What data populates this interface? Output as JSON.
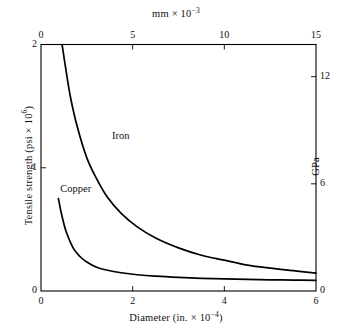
{
  "chart_data": {
    "type": "line",
    "title": "",
    "xlabel": "Diameter (in. × 10⁻⁴)",
    "ylabel": "Tensile strength (psi × 10⁶)",
    "x2label": "mm × 10⁻³",
    "y2label": "GPa",
    "xlim": [
      0,
      6
    ],
    "ylim": [
      0,
      2
    ],
    "x2lim": [
      0,
      15
    ],
    "y2lim": [
      0,
      13.8
    ],
    "grid": false,
    "legend_position": "inline-labels",
    "xticks": [
      0,
      2,
      4,
      6
    ],
    "xticklabels": [
      "0",
      "2",
      "4",
      "6"
    ],
    "yticks": [
      0,
      1,
      2
    ],
    "yticklabels": [
      "0",
      "1",
      "2"
    ],
    "x2ticks": [
      0,
      5,
      10,
      15
    ],
    "x2ticklabels": [
      "0",
      "5",
      "10",
      "15"
    ],
    "y2ticks": [
      0,
      6,
      12
    ],
    "y2ticklabels": [
      "0",
      "6",
      "12"
    ],
    "series": [
      {
        "name": "Iron",
        "color": "#000000",
        "label_x": 1.55,
        "label_y": 1.25,
        "x": [
          0.46,
          0.55,
          0.65,
          0.8,
          1.0,
          1.2,
          1.45,
          1.75,
          2.1,
          2.5,
          3.0,
          3.5,
          4.0,
          4.5,
          5.0,
          5.5,
          6.0
        ],
        "y": [
          2.0,
          1.78,
          1.56,
          1.32,
          1.08,
          0.92,
          0.76,
          0.63,
          0.52,
          0.43,
          0.35,
          0.29,
          0.25,
          0.21,
          0.185,
          0.165,
          0.145
        ]
      },
      {
        "name": "Copper",
        "color": "#000000",
        "label_x": 0.42,
        "label_y": 0.82,
        "x": [
          0.38,
          0.45,
          0.55,
          0.7,
          0.85,
          1.0,
          1.2,
          1.45,
          1.75,
          2.1,
          2.5,
          3.0,
          3.5,
          4.0,
          4.5,
          5.0,
          5.5,
          6.0
        ],
        "y": [
          0.75,
          0.62,
          0.48,
          0.35,
          0.28,
          0.235,
          0.195,
          0.168,
          0.148,
          0.132,
          0.12,
          0.11,
          0.103,
          0.098,
          0.094,
          0.091,
          0.089,
          0.087
        ]
      }
    ]
  },
  "axes": {
    "top": {
      "title": "mm × 10",
      "exponent": "−3"
    },
    "bottom": {
      "title": "Diameter (in. × 10",
      "exponent": "−4",
      "close": ")"
    },
    "left": {
      "title": "Tensile strength (psi × 10",
      "exponent": "6",
      "close": ")"
    },
    "right": {
      "title": "GPa"
    }
  }
}
